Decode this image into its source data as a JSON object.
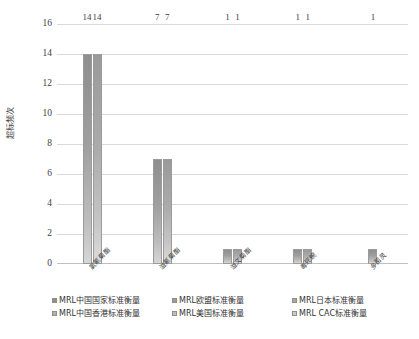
{
  "chart_data": {
    "type": "bar",
    "title": "",
    "xlabel": "",
    "ylabel": "超标频次",
    "ylim": [
      0,
      16
    ],
    "ytick_step": 2,
    "yticks": [
      16,
      14,
      12,
      10,
      8,
      6,
      4,
      2,
      0
    ],
    "grid": "horizontal",
    "legend_position": "bottom",
    "categories": [
      "氯氰菊酯",
      "溢氰菊酯",
      "溢文菊酯",
      "毒死蜿",
      "多菌灵"
    ],
    "series": [
      {
        "name": "MRL中国国家标准衡量",
        "values": [
          14,
          7,
          1,
          1,
          1
        ],
        "color": "#8e8e8e"
      },
      {
        "name": "MRL欧盟标准衡量",
        "values": [
          14,
          7,
          1,
          1,
          null
        ],
        "color": "#9a9a9a"
      },
      {
        "name": "MRL日本标准衡量",
        "values": [
          null,
          null,
          null,
          null,
          null
        ],
        "color": "#a6a6a6"
      },
      {
        "name": "MRL中国香港标准衡量",
        "values": [
          null,
          null,
          null,
          null,
          null
        ],
        "color": "#b2b2b2"
      },
      {
        "name": "MRL美国标准衡量",
        "values": [
          null,
          null,
          null,
          null,
          null
        ],
        "color": "#bebebe"
      },
      {
        "name": "MRL CAC标准衡量",
        "values": [
          null,
          null,
          null,
          null,
          null
        ],
        "color": "#cacaca"
      }
    ],
    "bars": [
      {
        "category_index": 0,
        "values": [
          14,
          14
        ],
        "labels": [
          "14",
          "14"
        ]
      },
      {
        "category_index": 1,
        "values": [
          7,
          7
        ],
        "labels": [
          "7",
          "7"
        ]
      },
      {
        "category_index": 2,
        "values": [
          1,
          1
        ],
        "labels": [
          "1",
          "1"
        ]
      },
      {
        "category_index": 3,
        "values": [
          1,
          1
        ],
        "labels": [
          "1",
          "1"
        ]
      },
      {
        "category_index": 4,
        "values": [
          1
        ],
        "labels": [
          "1"
        ]
      }
    ]
  },
  "axis": {
    "y_title": "超标频次",
    "y_ticks": [
      "16",
      "14",
      "12",
      "10",
      "8",
      "6",
      "4",
      "2",
      "0"
    ]
  },
  "x_categories": [
    {
      "label": "氯氰菊酯"
    },
    {
      "label": "溢氰菊酯"
    },
    {
      "label": "溢文菊酯"
    },
    {
      "label": "毒死蜿"
    },
    {
      "label": "多菌灵"
    }
  ],
  "legend": {
    "items": [
      {
        "label": "MRL中国国家标准衡量",
        "color": "#8e8e8e"
      },
      {
        "label": "MRL欧盟标准衡量",
        "color": "#9a9a9a"
      },
      {
        "label": "MRL日本标准衡量",
        "color": "#a6a6a6"
      },
      {
        "label": "MRL中国香港标准衡量",
        "color": "#b2b2b2"
      },
      {
        "label": "MRL美国标准衡量",
        "color": "#bebebe"
      },
      {
        "label": "MRL CAC标准衡量",
        "color": "#cacaca"
      }
    ]
  },
  "bar_labels": {
    "cat0": [
      "14",
      "14"
    ],
    "cat1": [
      "7",
      "7"
    ],
    "cat2": [
      "1",
      "1"
    ],
    "cat3": [
      "1",
      "1"
    ],
    "cat4": [
      "1"
    ]
  }
}
